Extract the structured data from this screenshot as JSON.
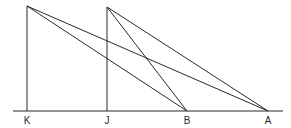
{
  "diagram": {
    "type": "geometry",
    "baseline": {
      "y": 111,
      "x1": 13,
      "x2": 283
    },
    "points": {
      "K": {
        "label": "K",
        "base": [
          27,
          111
        ],
        "top": [
          27,
          6
        ]
      },
      "J": {
        "label": "J",
        "base": [
          107,
          111
        ],
        "top": [
          107,
          7
        ]
      },
      "B": {
        "label": "B",
        "base": [
          187,
          111
        ]
      },
      "A": {
        "label": "A",
        "base": [
          268,
          111
        ]
      }
    },
    "labels": [
      "K",
      "J",
      "B",
      "A"
    ],
    "segments": [
      {
        "name": "vertical-K",
        "from": "K.top",
        "to": "K.base"
      },
      {
        "name": "vertical-J",
        "from": "J.top",
        "to": "J.base"
      },
      {
        "name": "K-top-to-B",
        "from": "K.top",
        "to": "B"
      },
      {
        "name": "K-top-to-A",
        "from": "K.top",
        "to": "A"
      },
      {
        "name": "J-top-to-B",
        "from": "J.top",
        "to": "B"
      },
      {
        "name": "J-top-to-A",
        "from": "J.top",
        "to": "A"
      }
    ]
  }
}
